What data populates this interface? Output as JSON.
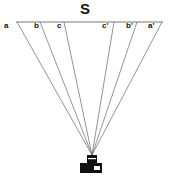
{
  "diagram": {
    "title": "S",
    "labels": [
      {
        "id": "a",
        "text": "a",
        "x": 4,
        "y": 22
      },
      {
        "id": "b",
        "text": "b",
        "x": 34,
        "y": 22
      },
      {
        "id": "c",
        "text": "c",
        "x": 57,
        "y": 22
      },
      {
        "id": "c-prime",
        "text": "c'",
        "x": 102,
        "y": 22
      },
      {
        "id": "b-prime",
        "text": "b'",
        "x": 126,
        "y": 22
      },
      {
        "id": "a-prime",
        "text": "a'",
        "x": 148,
        "y": 22
      }
    ],
    "colors": {
      "line": "#555555",
      "camera": "#111111"
    }
  }
}
